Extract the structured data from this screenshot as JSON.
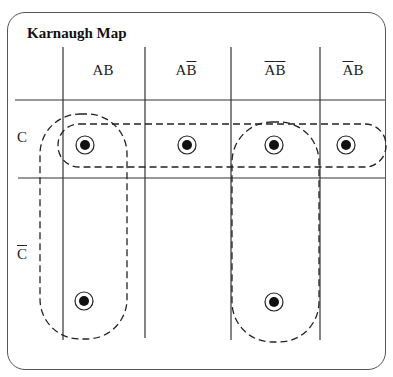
{
  "title": "Karnaugh Map",
  "columns": [
    {
      "label": "AB",
      "a_bar": false,
      "b_bar": false,
      "x": 103
    },
    {
      "label": "AB̄",
      "a_bar": false,
      "b_bar": true,
      "x": 186
    },
    {
      "label": "ĀB̄",
      "a_bar": true,
      "b_bar": true,
      "x": 275
    },
    {
      "label": "ĀB",
      "a_bar": true,
      "b_bar": false,
      "x": 353
    }
  ],
  "rows": [
    {
      "label": "C",
      "bar": false
    },
    {
      "label": "C̄",
      "bar": true
    }
  ],
  "col_a": {
    "A": "A",
    "B": "B"
  },
  "row_c": "C",
  "cells": [
    [
      1,
      1,
      1,
      1
    ],
    [
      1,
      0,
      1,
      0
    ]
  ],
  "groups": [
    {
      "name": "row C, all four columns",
      "shape": "horizontal-pill"
    },
    {
      "name": "column AB, C and C̄",
      "shape": "vertical-pill"
    },
    {
      "name": "column ĀB̄, C and C̄",
      "shape": "vertical-pill"
    }
  ]
}
